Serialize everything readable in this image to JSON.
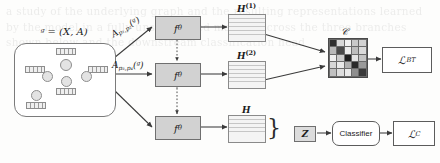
{
  "figure": {
    "background_text": "a study of the underlying graph and the resulting representations learned by the model in a fully unsupervised manner across the three branches shown below and the downstream classification head"
  },
  "graph": {
    "label": "ᵍ = (X, A)",
    "nodes": 5,
    "edges": 4
  },
  "augmentations": [
    {
      "id": "aug-top",
      "base": "A",
      "subscript": "p₁,p₂",
      "arg": "(ᵍ)",
      "text": "A",
      "sub": "p₁,p₂",
      "paren": "(ᵍ)"
    },
    {
      "id": "aug-middle",
      "base": "A",
      "subscript": "p₃,p₄",
      "arg": "(ᵍ)",
      "text": "A",
      "sub": "p₃,p₄",
      "paren": "(ᵍ)"
    }
  ],
  "encoders": [
    {
      "id": "encoder-1",
      "label": "f",
      "sub": "θ"
    },
    {
      "id": "encoder-2",
      "label": "f",
      "sub": "θ"
    },
    {
      "id": "encoder-3",
      "label": "f",
      "sub": "θ"
    }
  ],
  "shared_weights_note": "dotted double arrows indicate shared encoder weights",
  "embeddings": [
    {
      "id": "embedding-h1",
      "base": "H",
      "sup": "(1)"
    },
    {
      "id": "embedding-h2",
      "base": "H",
      "sup": "(2)"
    },
    {
      "id": "embedding-h",
      "base": "H",
      "sup": ""
    }
  ],
  "latent": {
    "label": "Z"
  },
  "correlation_matrix": {
    "label": "𝒞",
    "rows": 5,
    "cols": 5,
    "cells": [
      [
        "#2e2e2e",
        "#d8d8d8",
        "#f2f2f2",
        "#c9c9c9",
        "#d2d2d2"
      ],
      [
        "#b9b9b9",
        "#4a4a4a",
        "#ededed",
        "#bdbdbd",
        "#dadada"
      ],
      [
        "#f0f0f0",
        "#cccccc",
        "#1f1f1f",
        "#e4e4e4",
        "#c4c4c4"
      ],
      [
        "#d6d6d6",
        "#e8e8e8",
        "#b0b0b0",
        "#2a2a2a",
        "#9a9a9a"
      ],
      [
        "#c0c0c0",
        "#dddddd",
        "#eaeaea",
        "#8f8f8f",
        "#3a3a3a"
      ]
    ]
  },
  "outputs": {
    "loss_bt": {
      "base": "ℒ",
      "sub": "BT"
    },
    "classifier": {
      "label": "Classifier"
    },
    "loss_c": {
      "base": "ℒ",
      "sub": "C"
    }
  },
  "colors": {
    "encoder_fill": "#d2d2d2",
    "embedding_fill": "#f0f0f0",
    "stroke": "#5c5c5c",
    "panel_stroke": "#7b7b7b"
  }
}
